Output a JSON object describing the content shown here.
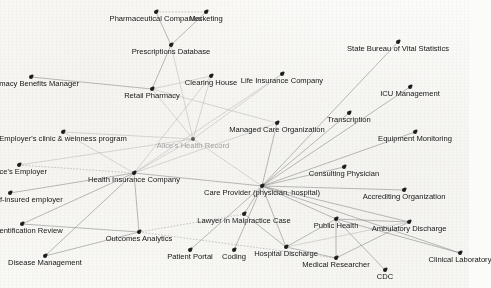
{
  "diagram": {
    "type": "node-link-graph",
    "colors": {
      "background": "#fbfbf9",
      "node": "#1d1d1d",
      "edge": "#8d8d8d",
      "edge_faint": "#b9b9b9",
      "label": "#141414",
      "label_ghost": "#9d9d9d"
    },
    "nodes": [
      {
        "id": "pharma_companies",
        "label": "Pharmaceutical Companies",
        "x": 156,
        "y": 12,
        "style": "normal",
        "align": "center"
      },
      {
        "id": "marketing",
        "label": "Marketing",
        "x": 206,
        "y": 12,
        "style": "normal",
        "align": "center"
      },
      {
        "id": "prescriptions_db",
        "label": "Prescriptions Database",
        "x": 171,
        "y": 45,
        "style": "normal",
        "align": "center"
      },
      {
        "id": "pharmacy_benefits",
        "label": "Pharmacy Benefits Manager",
        "x": 31,
        "y": 77,
        "style": "normal",
        "align": "center"
      },
      {
        "id": "clearing_house",
        "label": "Clearing House",
        "x": 211,
        "y": 76,
        "style": "normal",
        "align": "center"
      },
      {
        "id": "life_insurance",
        "label": "Life Insurance Company",
        "x": 282,
        "y": 74,
        "style": "normal",
        "align": "center"
      },
      {
        "id": "state_bureau",
        "label": "State Bureau of Vital Statistics",
        "x": 398,
        "y": 42,
        "style": "normal",
        "align": "center"
      },
      {
        "id": "icu_management",
        "label": "ICU Management",
        "x": 410,
        "y": 87,
        "style": "normal",
        "align": "center"
      },
      {
        "id": "retail_pharmacy",
        "label": "Retail Pharmacy",
        "x": 152,
        "y": 89,
        "style": "normal",
        "align": "center"
      },
      {
        "id": "managed_care",
        "label": "Managed Care Organization",
        "x": 277,
        "y": 123,
        "style": "normal",
        "align": "center"
      },
      {
        "id": "transcription",
        "label": "Transcription",
        "x": 349,
        "y": 113,
        "style": "normal",
        "align": "center"
      },
      {
        "id": "equipment_monitor",
        "label": "Equipment Monitoring",
        "x": 415,
        "y": 132,
        "style": "normal",
        "align": "center"
      },
      {
        "id": "employer_clinic",
        "label": "Employer's clinic & welnness program",
        "x": 63,
        "y": 132,
        "style": "normal",
        "align": "center"
      },
      {
        "id": "alice_record",
        "label": "Alice's Health Record",
        "x": 193,
        "y": 139,
        "style": "ghost",
        "align": "center"
      },
      {
        "id": "alice_employer",
        "label": "Alice's Employer",
        "x": 19,
        "y": 165,
        "style": "normal",
        "align": "center"
      },
      {
        "id": "health_insurance",
        "label": "Health Insurance Company",
        "x": 134,
        "y": 173,
        "style": "normal",
        "align": "center"
      },
      {
        "id": "consulting_phys",
        "label": "Consulting Physician",
        "x": 344,
        "y": 167,
        "style": "normal",
        "align": "center"
      },
      {
        "id": "care_provider",
        "label": "Care Provider (physician, hospital)",
        "x": 262,
        "y": 186,
        "style": "normal",
        "align": "center"
      },
      {
        "id": "accrediting_org",
        "label": "Accrediting Organization",
        "x": 404,
        "y": 190,
        "style": "normal",
        "align": "center"
      },
      {
        "id": "spouse_employer",
        "label": "Spouse's self-insured employer",
        "x": 10,
        "y": 193,
        "style": "normal",
        "align": "center"
      },
      {
        "id": "lawyer",
        "label": "Lawyer in Malpractice Case",
        "x": 244,
        "y": 214,
        "style": "normal",
        "align": "center"
      },
      {
        "id": "public_health",
        "label": "Public Health",
        "x": 336,
        "y": 219,
        "style": "normal",
        "align": "center"
      },
      {
        "id": "ambulatory",
        "label": "Ambulatory Discharge",
        "x": 409,
        "y": 222,
        "style": "normal",
        "align": "center"
      },
      {
        "id": "deident_review",
        "label": "De-identification Review",
        "x": 22,
        "y": 224,
        "style": "normal",
        "align": "center"
      },
      {
        "id": "outcomes",
        "label": "Outcomes Analytics",
        "x": 139,
        "y": 232,
        "style": "normal",
        "align": "center"
      },
      {
        "id": "hospital_discharge",
        "label": "Hospital Discharge",
        "x": 286,
        "y": 247,
        "style": "normal",
        "align": "center"
      },
      {
        "id": "clinical_lab",
        "label": "Clinical Laboratory",
        "x": 460,
        "y": 253,
        "style": "normal",
        "align": "center"
      },
      {
        "id": "patient_portal",
        "label": "Patient Portal",
        "x": 190,
        "y": 250,
        "style": "normal",
        "align": "center"
      },
      {
        "id": "coding",
        "label": "Coding",
        "x": 234,
        "y": 250,
        "style": "normal",
        "align": "center"
      },
      {
        "id": "medical_researcher",
        "label": "Medical Researcher",
        "x": 336,
        "y": 258,
        "style": "normal",
        "align": "center"
      },
      {
        "id": "disease_mgmt",
        "label": "Disease Management",
        "x": 45,
        "y": 256,
        "style": "normal",
        "align": "center"
      },
      {
        "id": "cdc",
        "label": "CDC",
        "x": 385,
        "y": 270,
        "style": "normal",
        "align": "center"
      }
    ],
    "edges": [
      {
        "from": "pharma_companies",
        "to": "marketing",
        "style": "dotted"
      },
      {
        "from": "pharma_companies",
        "to": "prescriptions_db",
        "style": "solid"
      },
      {
        "from": "marketing",
        "to": "prescriptions_db",
        "style": "solid"
      },
      {
        "from": "prescriptions_db",
        "to": "retail_pharmacy",
        "style": "solid"
      },
      {
        "from": "pharmacy_benefits",
        "to": "retail_pharmacy",
        "style": "solid"
      },
      {
        "from": "retail_pharmacy",
        "to": "alice_record",
        "style": "faint"
      },
      {
        "from": "retail_pharmacy",
        "to": "managed_care",
        "style": "faint"
      },
      {
        "from": "clearing_house",
        "to": "retail_pharmacy",
        "style": "faint"
      },
      {
        "from": "clearing_house",
        "to": "health_insurance",
        "style": "faint"
      },
      {
        "from": "clearing_house",
        "to": "alice_record",
        "style": "faint"
      },
      {
        "from": "life_insurance",
        "to": "alice_record",
        "style": "faint"
      },
      {
        "from": "life_insurance",
        "to": "health_insurance",
        "style": "faint"
      },
      {
        "from": "state_bureau",
        "to": "care_provider",
        "style": "solid"
      },
      {
        "from": "icu_management",
        "to": "care_provider",
        "style": "solid"
      },
      {
        "from": "transcription",
        "to": "care_provider",
        "style": "solid"
      },
      {
        "from": "equipment_monitor",
        "to": "care_provider",
        "style": "solid"
      },
      {
        "from": "managed_care",
        "to": "care_provider",
        "style": "solid"
      },
      {
        "from": "consulting_phys",
        "to": "care_provider",
        "style": "solid"
      },
      {
        "from": "accrediting_org",
        "to": "care_provider",
        "style": "solid"
      },
      {
        "from": "ambulatory",
        "to": "care_provider",
        "style": "solid"
      },
      {
        "from": "clinical_lab",
        "to": "care_provider",
        "style": "solid"
      },
      {
        "from": "public_health",
        "to": "care_provider",
        "style": "solid"
      },
      {
        "from": "lawyer",
        "to": "care_provider",
        "style": "solid"
      },
      {
        "from": "hospital_discharge",
        "to": "care_provider",
        "style": "solid"
      },
      {
        "from": "coding",
        "to": "care_provider",
        "style": "solid"
      },
      {
        "from": "patient_portal",
        "to": "care_provider",
        "style": "solid"
      },
      {
        "from": "alice_record",
        "to": "care_provider",
        "style": "faint"
      },
      {
        "from": "health_insurance",
        "to": "care_provider",
        "style": "solid"
      },
      {
        "from": "employer_clinic",
        "to": "alice_record",
        "style": "faint"
      },
      {
        "from": "employer_clinic",
        "to": "health_insurance",
        "style": "faint"
      },
      {
        "from": "alice_employer",
        "to": "health_insurance",
        "style": "dotted"
      },
      {
        "from": "alice_employer",
        "to": "alice_record",
        "style": "faint"
      },
      {
        "from": "spouse_employer",
        "to": "health_insurance",
        "style": "solid"
      },
      {
        "from": "health_insurance",
        "to": "alice_record",
        "style": "faint"
      },
      {
        "from": "health_insurance",
        "to": "outcomes",
        "style": "solid"
      },
      {
        "from": "health_insurance",
        "to": "disease_mgmt",
        "style": "solid"
      },
      {
        "from": "health_insurance",
        "to": "deident_review",
        "style": "solid"
      },
      {
        "from": "outcomes",
        "to": "deident_review",
        "style": "solid"
      },
      {
        "from": "outcomes",
        "to": "disease_mgmt",
        "style": "solid"
      },
      {
        "from": "outcomes",
        "to": "lawyer",
        "style": "dotted"
      },
      {
        "from": "outcomes",
        "to": "medical_researcher",
        "style": "dotted"
      },
      {
        "from": "public_health",
        "to": "medical_researcher",
        "style": "solid"
      },
      {
        "from": "public_health",
        "to": "cdc",
        "style": "solid"
      },
      {
        "from": "public_health",
        "to": "hospital_discharge",
        "style": "solid"
      },
      {
        "from": "public_health",
        "to": "ambulatory",
        "style": "solid"
      },
      {
        "from": "public_health",
        "to": "clinical_lab",
        "style": "solid"
      },
      {
        "from": "hospital_discharge",
        "to": "medical_researcher",
        "style": "solid"
      },
      {
        "from": "ambulatory",
        "to": "medical_researcher",
        "style": "solid"
      },
      {
        "from": "hospital_discharge",
        "to": "ambulatory",
        "style": "faint"
      },
      {
        "from": "lawyer",
        "to": "hospital_discharge",
        "style": "solid"
      },
      {
        "from": "managed_care",
        "to": "health_insurance",
        "style": "faint"
      },
      {
        "from": "prescriptions_db",
        "to": "alice_record",
        "style": "faint"
      }
    ]
  }
}
